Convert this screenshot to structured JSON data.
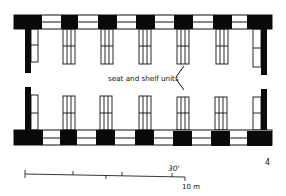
{
  "diagram": {
    "figure_number": "4",
    "colors": {
      "wall": "#0a0a0a",
      "line": "#1a1a1a",
      "background": "#ffffff"
    },
    "annotation": {
      "label": "seat and shelf units"
    },
    "scale_bar": {
      "imperial_label": "30'",
      "metric_label": "10 m"
    },
    "top_wall": {
      "piers_x": [
        [
          61,
          78
        ],
        [
          98,
          117
        ],
        [
          136,
          155
        ],
        [
          174,
          193
        ],
        [
          213,
          232
        ]
      ],
      "end_left": [
        14,
        42
      ],
      "end_right": [
        247,
        272
      ]
    },
    "seat_units_x": [
      63,
      101,
      139,
      177,
      216
    ],
    "rows": [
      "north",
      "south"
    ]
  }
}
